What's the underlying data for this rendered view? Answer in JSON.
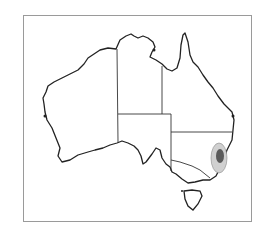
{
  "map": {
    "subject": "Australia distribution map",
    "colors": {
      "outline": "#222222",
      "frame": "#9a9a9a",
      "range_outer": "#d0d0d0",
      "range_inner": "#5a5a5a",
      "background": "#ffffff"
    },
    "highlighted_region": "south-eastern New South Wales (coastal ranges)"
  }
}
